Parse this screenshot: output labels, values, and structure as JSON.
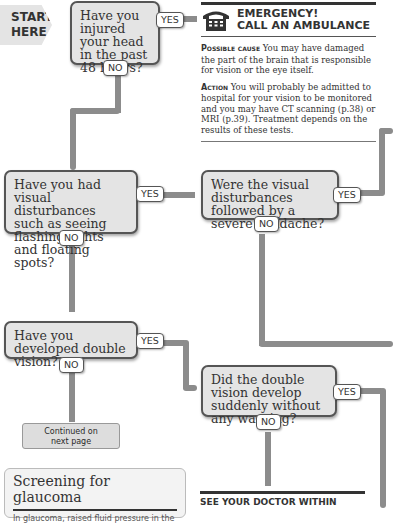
{
  "start": {
    "line1": "START",
    "line2": "HERE"
  },
  "questions": [
    {
      "id": "q1",
      "text": "Have you injured your head in the past 48 hours?",
      "yes": "YES",
      "no": "NO"
    },
    {
      "id": "q2",
      "text": "Have you had visual disturbances such as seeing flashing lights and floating spots?",
      "yes": "YES",
      "no": "NO"
    },
    {
      "id": "q3",
      "text": "Were the visual disturbances followed by a severe headache?",
      "yes": "YES",
      "no": "NO"
    },
    {
      "id": "q4",
      "text": "Have you developed double vision?",
      "yes": "YES",
      "no": "NO"
    },
    {
      "id": "q5",
      "text": "Did the double vision develop suddenly without any warning?",
      "yes": "YES",
      "no": "NO"
    }
  ],
  "emergency": {
    "icon": "telephone-icon",
    "title_line1": "EMERGENCY!",
    "title_line2": "CALL AN AMBULANCE",
    "cause_label": "Possible cause",
    "cause_text": "You may have damaged the part of the brain that is responsible for vision or the eye itself.",
    "action_label": "Action",
    "action_text": "You will probably be admitted to hospital for your vision to be monitored and you may have CT scanning (p.38) or MRI (p.39). Treatment depends on the results of these tests."
  },
  "continued": {
    "line1": "Continued on",
    "line2": "next page"
  },
  "glaucoma": {
    "title": "Screening for glaucoma",
    "text": "In glaucoma, raised fluid pressure in the"
  },
  "see_doctor": {
    "text": "SEE YOUR DOCTOR WITHIN"
  },
  "colors": {
    "box_fill": "#e4e4e4",
    "pipe": "#8c8c8c",
    "border": "#555555"
  }
}
